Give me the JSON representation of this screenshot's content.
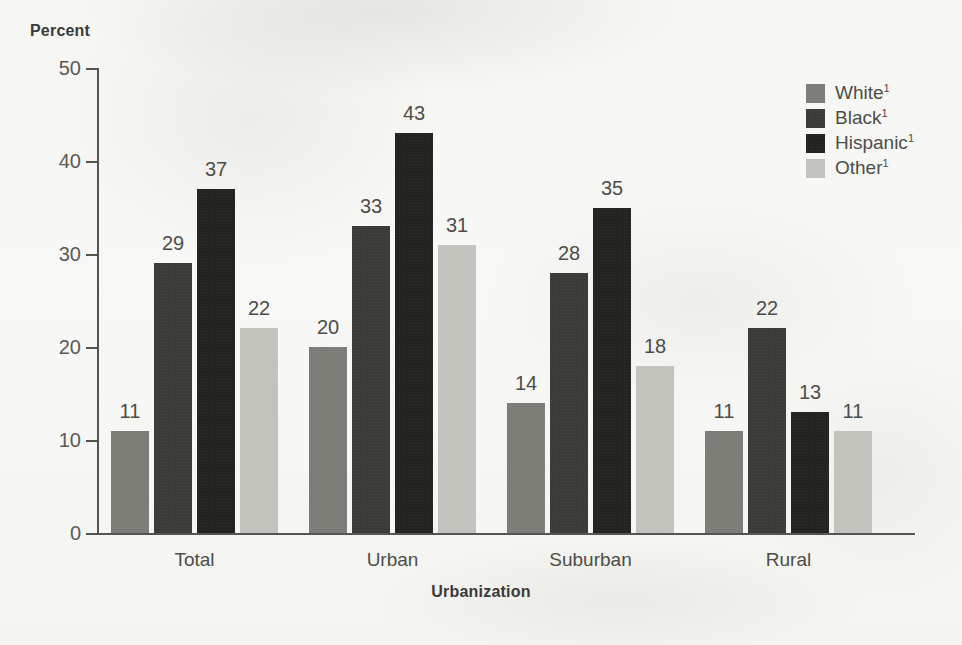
{
  "chart_data": {
    "type": "bar",
    "title": "",
    "xlabel": "Urbanization",
    "ylabel": "Percent",
    "ylim": [
      0,
      50
    ],
    "yticks": [
      0,
      10,
      20,
      30,
      40,
      50
    ],
    "grid": false,
    "legend_position": "top-right",
    "categories": [
      "Total",
      "Urban",
      "Suburban",
      "Rural"
    ],
    "series": [
      {
        "name": "White",
        "footnote_marker": "1",
        "color": "#7d7d78",
        "values": [
          11,
          20,
          14,
          11
        ]
      },
      {
        "name": "Black",
        "footnote_marker": "1",
        "color": "#3b3b38",
        "values": [
          29,
          33,
          28,
          22
        ]
      },
      {
        "name": "Hispanic",
        "footnote_marker": "1",
        "color": "#232321",
        "values": [
          37,
          43,
          35,
          13
        ]
      },
      {
        "name": "Other",
        "footnote_marker": "1",
        "color": "#c3c3bd",
        "values": [
          22,
          31,
          18,
          11
        ]
      }
    ]
  },
  "axes": {
    "y_title": "Percent",
    "x_title": "Urbanization",
    "y_tick_labels": [
      "50",
      "40",
      "30",
      "20",
      "10",
      "0"
    ]
  },
  "legend": {
    "items": [
      {
        "label": "White",
        "marker": "1",
        "color": "#7d7d78"
      },
      {
        "label": "Black",
        "marker": "1",
        "color": "#3b3b38"
      },
      {
        "label": "Hispanic",
        "marker": "1",
        "color": "#232321"
      },
      {
        "label": "Other",
        "marker": "1",
        "color": "#c3c3bd"
      }
    ]
  }
}
